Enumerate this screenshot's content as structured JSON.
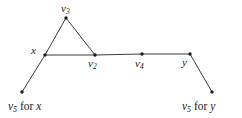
{
  "figure": {
    "type": "graph-diagram",
    "width": 242,
    "height": 118,
    "background_color": "#ffffff",
    "stroke_color": "#3a3a42",
    "node_color": "#1a1a1a"
  },
  "nodes": [
    {
      "id": "v3",
      "label_html": "v<sub>3</sub>",
      "label_text": "v3",
      "x": 66,
      "y": 18,
      "label_x": 61,
      "label_y": 3,
      "label_anchor": "above"
    },
    {
      "id": "x",
      "label_html": "x",
      "label_text": "x",
      "x": 45,
      "y": 55,
      "label_x": 31,
      "label_y": 45,
      "label_anchor": "left"
    },
    {
      "id": "v2",
      "label_html": "v<sub>2</sub>",
      "label_text": "v2",
      "x": 95,
      "y": 55,
      "label_x": 88,
      "label_y": 58,
      "label_anchor": "below"
    },
    {
      "id": "v4",
      "label_html": "v<sub>4</sub>",
      "label_text": "v4",
      "x": 142,
      "y": 54,
      "label_x": 135,
      "label_y": 58,
      "label_anchor": "below"
    },
    {
      "id": "y",
      "label_html": "y",
      "label_text": "y",
      "x": 190,
      "y": 54,
      "label_x": 182,
      "label_y": 57,
      "label_anchor": "below-left"
    },
    {
      "id": "v5x",
      "label_html": "",
      "label_text": "",
      "x": 22,
      "y": 92,
      "label_x": 0,
      "label_y": 0,
      "label_anchor": "none"
    },
    {
      "id": "v5y",
      "label_html": "",
      "label_text": "",
      "x": 212,
      "y": 92,
      "label_x": 0,
      "label_y": 0,
      "label_anchor": "none"
    }
  ],
  "edges": [
    {
      "from": "x",
      "to": "v3",
      "x1": 45,
      "y1": 55,
      "x2": 66,
      "y2": 18
    },
    {
      "from": "v3",
      "to": "v2",
      "x1": 66,
      "y1": 18,
      "x2": 95,
      "y2": 55
    },
    {
      "from": "x",
      "to": "v2",
      "x1": 45,
      "y1": 55,
      "x2": 95,
      "y2": 55
    },
    {
      "from": "v2",
      "to": "v4",
      "x1": 95,
      "y1": 55,
      "x2": 142,
      "y2": 54
    },
    {
      "from": "v4",
      "to": "y",
      "x1": 142,
      "y1": 54,
      "x2": 190,
      "y2": 54
    },
    {
      "from": "x",
      "to": "v5x",
      "x1": 45,
      "y1": 55,
      "x2": 22,
      "y2": 92
    },
    {
      "from": "y",
      "to": "v5y",
      "x1": 190,
      "y1": 54,
      "x2": 212,
      "y2": 92
    }
  ],
  "captions": [
    {
      "id": "caption-left",
      "full_text": "v5 for x",
      "var_label": "v",
      "var_sub": "5",
      "conjunction": "for",
      "target": "x",
      "x": 8,
      "y": 101
    },
    {
      "id": "caption-right",
      "full_text": "v5 for y",
      "var_label": "v",
      "var_sub": "5",
      "conjunction": "for",
      "target": "y",
      "x": 182,
      "y": 101
    }
  ]
}
